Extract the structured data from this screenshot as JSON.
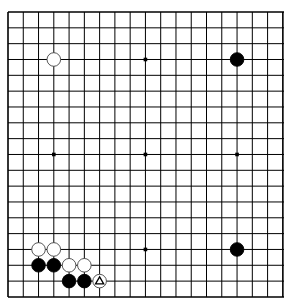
{
  "board": {
    "size": 19,
    "visible_columns": 19,
    "origin_x": 8,
    "origin_y": 12,
    "spacing_x": 15.27,
    "spacing_y": 15.83,
    "line_color": "#000000",
    "background": "#ffffff",
    "star_points": [
      [
        3,
        9
      ],
      [
        9,
        3
      ],
      [
        9,
        9
      ],
      [
        9,
        15
      ],
      [
        15,
        9
      ]
    ],
    "stones": [
      {
        "color": "white",
        "col": 3,
        "row": 3
      },
      {
        "color": "black",
        "col": 15,
        "row": 3
      },
      {
        "color": "black",
        "col": 15,
        "row": 15
      },
      {
        "color": "white",
        "col": 2,
        "row": 15
      },
      {
        "color": "white",
        "col": 3,
        "row": 15
      },
      {
        "color": "black",
        "col": 2,
        "row": 16
      },
      {
        "color": "black",
        "col": 3,
        "row": 16
      },
      {
        "color": "white",
        "col": 4,
        "row": 16
      },
      {
        "color": "white",
        "col": 5,
        "row": 16
      },
      {
        "color": "black",
        "col": 4,
        "row": 17
      },
      {
        "color": "black",
        "col": 5,
        "row": 17
      },
      {
        "color": "white",
        "col": 6,
        "row": 17,
        "marker": "triangle"
      }
    ]
  }
}
